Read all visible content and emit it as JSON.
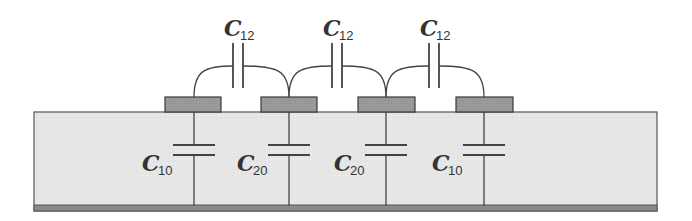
{
  "diagram": {
    "type": "coupled-microstrip-capacitance-model",
    "colors": {
      "substrate_fill": "#e6e6e6",
      "substrate_border": "#555555",
      "ground_plane": "#8a8a8a",
      "conductor_fill": "#9a9a9a",
      "wire": "#444444"
    },
    "substrate": {
      "x": 34,
      "y": 112,
      "width": 623,
      "height": 99
    },
    "ground": {
      "x": 34,
      "y": 205,
      "width": 623,
      "height": 6
    },
    "conductors": [
      {
        "id": "1",
        "x": 165,
        "y": 97,
        "width": 56,
        "height": 15,
        "tap_x": 194
      },
      {
        "id": "2",
        "x": 261,
        "y": 97,
        "width": 56,
        "height": 15,
        "tap_x": 289
      },
      {
        "id": "3",
        "x": 358,
        "y": 97,
        "width": 57,
        "height": 15,
        "tap_x": 386
      },
      {
        "id": "4",
        "x": 456,
        "y": 97,
        "width": 57,
        "height": 15,
        "tap_x": 484
      }
    ],
    "mutual_capacitors": [
      {
        "label": "C",
        "subscript": "12",
        "x": 238,
        "label_x": 224,
        "label_y": 36
      },
      {
        "label": "C",
        "subscript": "12",
        "x": 337,
        "label_x": 323,
        "label_y": 36
      },
      {
        "label": "C",
        "subscript": "12",
        "x": 434,
        "label_x": 420,
        "label_y": 36
      }
    ],
    "ground_capacitors": [
      {
        "label": "C",
        "subscript": "10",
        "x": 194,
        "label_x": 142,
        "label_y": 171
      },
      {
        "label": "C",
        "subscript": "20",
        "x": 289,
        "label_x": 237,
        "label_y": 171
      },
      {
        "label": "C",
        "subscript": "20",
        "x": 386,
        "label_x": 334,
        "label_y": 171
      },
      {
        "label": "C",
        "subscript": "10",
        "x": 484,
        "label_x": 432,
        "label_y": 171
      }
    ]
  }
}
